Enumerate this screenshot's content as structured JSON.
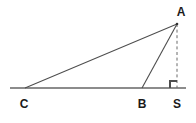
{
  "figure": {
    "type": "geometry-diagram",
    "width": 196,
    "height": 123,
    "background_color": "#ffffff",
    "stroke_color": "#4d4d4d",
    "baseline_color": "#8c8c8c",
    "label_color": "#1a1a1a",
    "stroke_width": 1
  },
  "points": {
    "A": {
      "label": "A",
      "x": 177,
      "y": 24,
      "label_x": 181,
      "label_y": 12
    },
    "C": {
      "label": "C",
      "x": 25,
      "y": 88,
      "label_x": 24,
      "label_y": 104
    },
    "B": {
      "label": "B",
      "x": 142,
      "y": 88,
      "label_x": 142,
      "label_y": 104
    },
    "S": {
      "label": "S",
      "x": 177,
      "y": 88,
      "label_x": 177,
      "label_y": 104
    }
  },
  "segments": [
    {
      "name": "baseline",
      "from_x": 10,
      "from_y": 88,
      "to_x": 186,
      "to_y": 88,
      "style": "solid",
      "color": "#8c8c8c"
    },
    {
      "name": "segment-CA",
      "from_x": 25,
      "from_y": 88,
      "to_x": 177,
      "to_y": 24,
      "style": "solid",
      "color": "#4d4d4d"
    },
    {
      "name": "segment-BA",
      "from_x": 142,
      "from_y": 88,
      "to_x": 177,
      "to_y": 24,
      "style": "solid",
      "color": "#4d4d4d"
    },
    {
      "name": "segment-AS-altitude",
      "from_x": 177,
      "from_y": 24,
      "to_x": 177,
      "to_y": 88,
      "style": "dashed",
      "color": "#6a6a6a"
    }
  ],
  "right_angle": {
    "name": "right-angle-mark-at-S",
    "vertex_x": 177,
    "vertex_y": 88,
    "size": 7,
    "opens": "left",
    "color": "#4d4d4d"
  },
  "labels": [
    "A",
    "C",
    "B",
    "S"
  ]
}
